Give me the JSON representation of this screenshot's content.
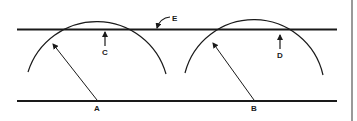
{
  "diagram": {
    "type": "technical-line-drawing",
    "colors": {
      "stroke": "#1a1a1a",
      "background": "#ffffff"
    },
    "labels": {
      "A": "A",
      "B": "B",
      "C": "C",
      "D": "D",
      "E": "E"
    },
    "elements": {
      "top_line": {
        "label": "E",
        "description": "upper straight line"
      },
      "bottom_line": {
        "description": "lower straight line"
      },
      "left_arc": {
        "center_label": "A",
        "description": "arc with radius arrow from A, tangent to upper line"
      },
      "right_arc": {
        "center_label": "B",
        "description": "arc with radius arrow from B, below upper line"
      },
      "gap_c": {
        "label": "C",
        "description": "arrow at tangent point of left arc"
      },
      "gap_d": {
        "label": "D",
        "description": "arrow indicating gap between right arc and upper line"
      }
    }
  }
}
